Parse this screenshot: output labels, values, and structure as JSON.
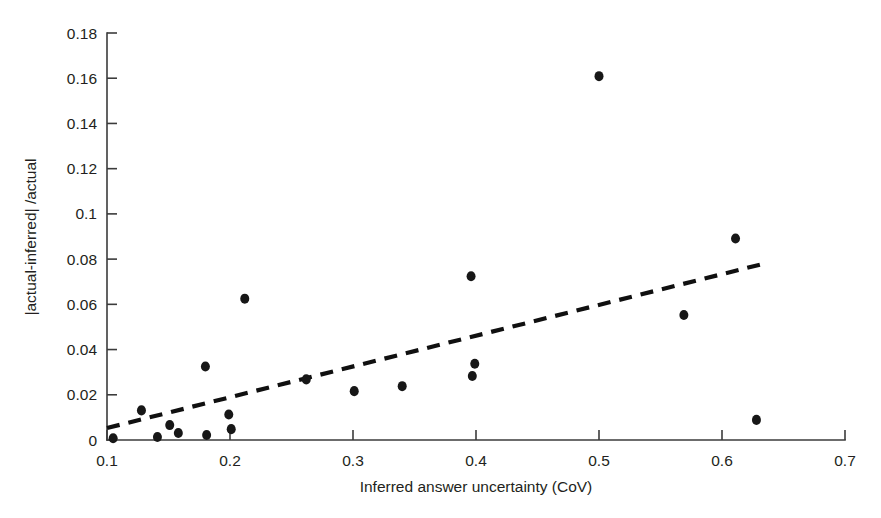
{
  "chart_data": {
    "type": "scatter",
    "title": "",
    "xlabel": "Inferred answer uncertainty (CoV)",
    "ylabel": "|actual-inferred| /actual",
    "xlim": [
      0.1,
      0.7
    ],
    "ylim": [
      0,
      0.18
    ],
    "xticks": [
      0.1,
      0.2,
      0.3,
      0.4,
      0.5,
      0.6,
      0.7
    ],
    "yticks": [
      0,
      0.02,
      0.04,
      0.06,
      0.08,
      0.1,
      0.12,
      0.14,
      0.16,
      0.18
    ],
    "xtick_labels": [
      "0.1",
      "0.2",
      "0.3",
      "0.4",
      "0.5",
      "0.6",
      "0.7"
    ],
    "ytick_labels": [
      "0",
      "0.02",
      "0.04",
      "0.06",
      "0.08",
      "0.1",
      "0.12",
      "0.14",
      "0.16",
      "0.18"
    ],
    "grid": false,
    "legend": null,
    "marker": {
      "shape": "circle",
      "color": "#171717",
      "size": 9
    },
    "points": [
      {
        "x": 0.105,
        "y": 0.0008
      },
      {
        "x": 0.128,
        "y": 0.0131
      },
      {
        "x": 0.141,
        "y": 0.0013
      },
      {
        "x": 0.151,
        "y": 0.0066
      },
      {
        "x": 0.158,
        "y": 0.0031
      },
      {
        "x": 0.18,
        "y": 0.0325
      },
      {
        "x": 0.181,
        "y": 0.0022
      },
      {
        "x": 0.199,
        "y": 0.0113
      },
      {
        "x": 0.201,
        "y": 0.0048
      },
      {
        "x": 0.212,
        "y": 0.0625
      },
      {
        "x": 0.262,
        "y": 0.0268
      },
      {
        "x": 0.301,
        "y": 0.0216
      },
      {
        "x": 0.34,
        "y": 0.0238
      },
      {
        "x": 0.396,
        "y": 0.0724
      },
      {
        "x": 0.399,
        "y": 0.0337
      },
      {
        "x": 0.397,
        "y": 0.0283
      },
      {
        "x": 0.5,
        "y": 0.1609
      },
      {
        "x": 0.569,
        "y": 0.0553
      },
      {
        "x": 0.611,
        "y": 0.0891
      },
      {
        "x": 0.628,
        "y": 0.0089
      }
    ],
    "trendline": {
      "style": "dashed",
      "color": "#101010",
      "x_start": 0.1,
      "y_start": 0.0053,
      "x_end": 0.632,
      "y_end": 0.0777
    }
  }
}
